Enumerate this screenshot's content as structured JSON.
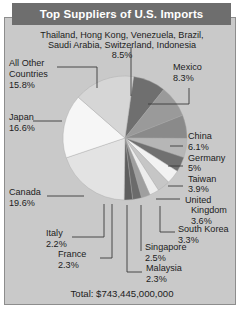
{
  "header": {
    "title": "Top Suppliers of U.S. Imports"
  },
  "footer": {
    "total_label": "Total: $743,445,000,000"
  },
  "top_note": {
    "line1": "Thailand, Hong Kong, Venezuela, Brazil,",
    "line2": "Saudi Arabia, Switzerland, Indonesia",
    "value": "8.5%"
  },
  "labels": {
    "all_other_1": "All Other",
    "all_other_2": "Countries",
    "all_other_v": "15.8%",
    "japan": "Japan",
    "japan_v": "16.6%",
    "canada": "Canada",
    "canada_v": "19.6%",
    "italy": "Italy",
    "italy_v": "2.2%",
    "france": "France",
    "france_v": "2.3%",
    "mexico": "Mexico",
    "mexico_v": "8.3%",
    "china": "China",
    "china_v": "6.1%",
    "germany": "Germany",
    "germany_v": "5%",
    "taiwan": "Taiwan",
    "taiwan_v": "3.9%",
    "uk_1": "United",
    "uk_2": "Kingdom",
    "uk_v": "3.6%",
    "skorea": "South Korea",
    "skorea_v": "3.3%",
    "singapore": "Singapore",
    "singapore_v": "2.5%",
    "malaysia": "Malaysia",
    "malaysia_v": "2.3%"
  },
  "chart_data": {
    "type": "pie",
    "title": "Top Suppliers of U.S. Imports",
    "total": "$743,445,000,000",
    "total_value": 743445000000,
    "units": "percent of U.S. imports",
    "legend": "labels-with-leader-lines",
    "grid": false,
    "categories": [
      "Thailand, Hong Kong, Venezuela, Brazil, Saudi Arabia, Switzerland, Indonesia",
      "Mexico",
      "China",
      "Germany",
      "Taiwan",
      "United Kingdom",
      "South Korea",
      "Singapore",
      "Malaysia",
      "France",
      "Italy",
      "Canada",
      "Japan",
      "All Other Countries"
    ],
    "values": [
      8.5,
      8.3,
      6.1,
      5,
      3.9,
      3.6,
      3.3,
      2.5,
      2.3,
      2.3,
      2.2,
      19.6,
      16.6,
      15.8
    ],
    "colors": [
      "#6f6f6f",
      "#9a9a9a",
      "#8a8a8a",
      "#b6b6b6",
      "#707070",
      "#f2f2f2",
      "#c6c6c6",
      "#ededed",
      "#9f9f9f",
      "#6b6b6b",
      "#5e5e5e",
      "#e3e3e3",
      "#f6f6f6",
      "#d6d6d6"
    ]
  }
}
